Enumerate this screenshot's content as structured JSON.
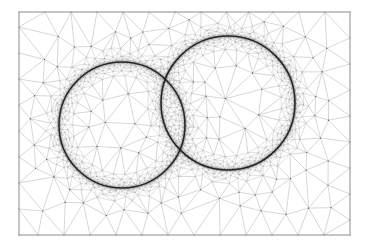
{
  "figure": {
    "background_color": "#ffffff"
  },
  "frame": {
    "name": "domain-boundary",
    "x": 19,
    "y": 12,
    "width": 331,
    "height": 223,
    "stroke_color": "#b8b8b8",
    "stroke_width": 0.9,
    "fill_color": "#ffffff"
  },
  "mesh": {
    "type": "triangular",
    "element_shape": "triangle",
    "coarse_stroke_color": "#8a8a8a",
    "fine_stroke_color": "#555555",
    "interface_stroke_color": "#1a1a1a",
    "coarse_stroke_width": 0.35,
    "fine_stroke_width": 0.22,
    "interface_stroke_width": 1.6,
    "node_color": "#444444",
    "node_radius": 0.55,
    "background_spacing": 26,
    "min_spacing": 1.6,
    "grading_exponent": 2.2,
    "refinement_band": 10,
    "seed": 20240517
  },
  "interfaces": [
    {
      "name": "circle-left",
      "label": "left circular interface",
      "cx": 122,
      "cy": 125,
      "r": 63,
      "segments": 460
    },
    {
      "name": "circle-right",
      "label": "right circular interface",
      "cx": 228,
      "cy": 103,
      "r": 67,
      "segments": 480
    }
  ],
  "intersections": [
    {
      "name": "upper-intersection",
      "x": 155,
      "y": 66
    },
    {
      "name": "lower-intersection",
      "x": 175,
      "y": 170
    }
  ]
}
